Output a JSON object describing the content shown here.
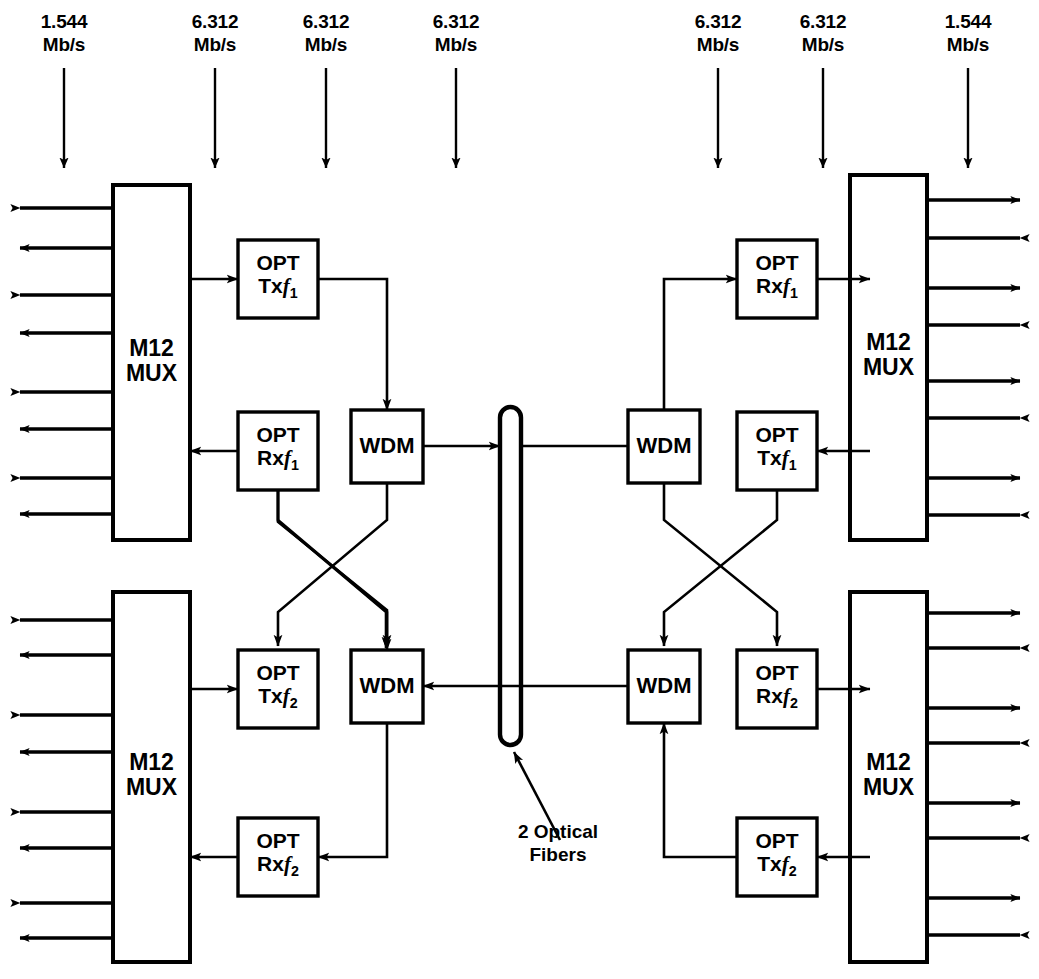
{
  "diagram": {
    "stroke_color": "#000000",
    "background_color": "#ffffff"
  },
  "top_rate_labels": [
    {
      "name": "rate-top-1",
      "text": "1.544\nMb/s",
      "x": 64,
      "y": 10
    },
    {
      "name": "rate-top-2",
      "text": "6.312\nMb/s",
      "x": 215,
      "y": 10
    },
    {
      "name": "rate-top-3",
      "text": "6.312\nMb/s",
      "x": 326,
      "y": 10
    },
    {
      "name": "rate-top-4",
      "text": "6.312\nMb/s",
      "x": 456,
      "y": 10
    },
    {
      "name": "rate-top-5",
      "text": "6.312\nMb/s",
      "x": 718,
      "y": 10
    },
    {
      "name": "rate-top-6",
      "text": "6.312\nMb/s",
      "x": 823,
      "y": 10
    },
    {
      "name": "rate-top-7",
      "text": "1.544\nMb/s",
      "x": 968,
      "y": 10
    }
  ],
  "blocks": {
    "mux_top_left": {
      "label_line1": "M12",
      "label_line2": "MUX"
    },
    "mux_bottom_left": {
      "label_line1": "M12",
      "label_line2": "MUX"
    },
    "mux_top_right": {
      "label_line1": "M12",
      "label_line2": "MUX"
    },
    "mux_bottom_right": {
      "label_line1": "M12",
      "label_line2": "MUX"
    },
    "opt_tl_tx": {
      "line1": "OPT",
      "line2_prefix": "Tx",
      "line2_freq": "f",
      "line2_sub": "1"
    },
    "opt_tl_rx": {
      "line1": "OPT",
      "line2_prefix": "Rx",
      "line2_freq": "f",
      "line2_sub": "1"
    },
    "opt_bl_tx": {
      "line1": "OPT",
      "line2_prefix": "Tx",
      "line2_freq": "f",
      "line2_sub": "2"
    },
    "opt_bl_rx": {
      "line1": "OPT",
      "line2_prefix": "Rx",
      "line2_freq": "f",
      "line2_sub": "2"
    },
    "opt_tr_rx": {
      "line1": "OPT",
      "line2_prefix": "Rx",
      "line2_freq": "f",
      "line2_sub": "1"
    },
    "opt_tr_tx": {
      "line1": "OPT",
      "line2_prefix": "Tx",
      "line2_freq": "f",
      "line2_sub": "1"
    },
    "opt_br_rx": {
      "line1": "OPT",
      "line2_prefix": "Rx",
      "line2_freq": "f",
      "line2_sub": "2"
    },
    "opt_br_tx": {
      "line1": "OPT",
      "line2_prefix": "Tx",
      "line2_freq": "f",
      "line2_sub": "2"
    },
    "wdm_top_left": {
      "label": "WDM"
    },
    "wdm_bottom_left": {
      "label": "WDM"
    },
    "wdm_top_right": {
      "label": "WDM"
    },
    "wdm_bottom_right": {
      "label": "WDM"
    }
  },
  "annotations": {
    "fiber_callout": "2 Optical\nFibers"
  },
  "tributary_counts": {
    "per_mux": 8,
    "note": "alternating inbound/outbound arrows"
  }
}
